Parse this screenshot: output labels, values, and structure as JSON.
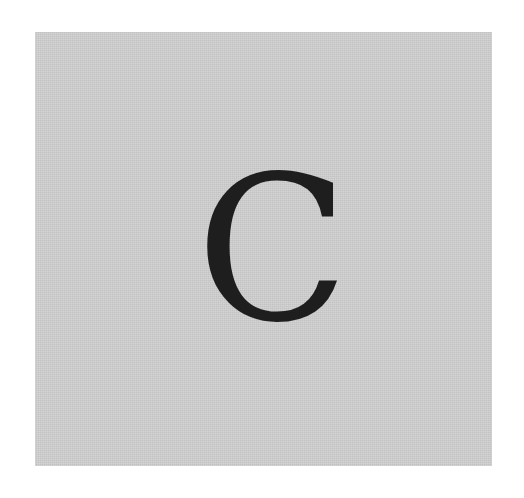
{
  "card": {
    "letter": "C",
    "background_color": "#cfcfcf",
    "letter_color": "#1e1e1e"
  }
}
